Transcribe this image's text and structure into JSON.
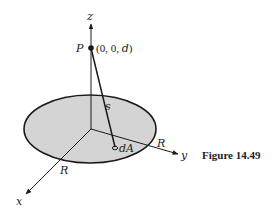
{
  "figure": {
    "caption": "Figure 14.49",
    "labels": {
      "z_axis": "z",
      "y_axis": "y",
      "x_axis": "x",
      "point_name": "P",
      "point_coords": "(0, 0, d)",
      "distance": "s",
      "area_element": "dA",
      "radius_x": "R",
      "radius_y": "R"
    },
    "colors": {
      "disk_fill": "#d4d4d4",
      "stroke": "#1a1a1a"
    }
  }
}
